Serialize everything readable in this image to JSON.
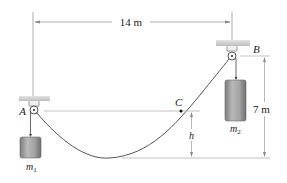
{
  "diagram": {
    "dimensions": {
      "horizontal_span": "14 m",
      "vertical_span": "7 m",
      "sag_height": "h"
    },
    "points": {
      "A": "A",
      "B": "B",
      "C": "C"
    },
    "masses": {
      "m1": {
        "base": "m",
        "sub": "1"
      },
      "m2": {
        "base": "m",
        "sub": "2"
      }
    },
    "colors": {
      "line": "#5a5a5a",
      "dim_line": "#8a8a8a",
      "support": "#c8c8c8",
      "mass_fill": "#9a9a9a",
      "text": "#222222"
    }
  }
}
